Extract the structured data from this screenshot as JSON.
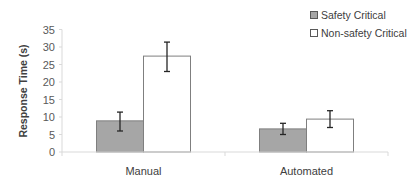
{
  "chart_data": {
    "type": "bar",
    "title": "",
    "xlabel": "",
    "ylabel": "Response Time (s)",
    "ylim": [
      0,
      35
    ],
    "yticks": [
      0,
      5,
      10,
      15,
      20,
      25,
      30,
      35
    ],
    "grid": false,
    "legend_position": "top-right",
    "categories": [
      "Manual",
      "Automated"
    ],
    "series": [
      {
        "name": "Safety Critical",
        "color": "#a6a6a6",
        "values": [
          8.9,
          6.6
        ],
        "error_low": [
          6.0,
          5.0
        ],
        "error_high": [
          11.4,
          8.2
        ]
      },
      {
        "name": "Non-safety Critical",
        "color": "#ffffff",
        "values": [
          27.4,
          9.4
        ],
        "error_low": [
          23.0,
          7.0
        ],
        "error_high": [
          31.4,
          11.8
        ]
      }
    ]
  }
}
